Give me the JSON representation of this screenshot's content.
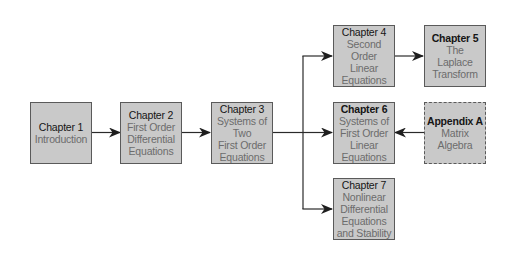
{
  "diagram": {
    "type": "flowchart",
    "colors": {
      "box_fill": "#c9c9c9",
      "box_border": "#5a5a5a",
      "title_text": "#151515",
      "subtitle_text": "#6c6c6c",
      "edge": "#2a2a2a"
    },
    "nodes": [
      {
        "id": "ch1",
        "title": "Chapter 1",
        "lines": [
          "Introduction"
        ],
        "style": "solid"
      },
      {
        "id": "ch2",
        "title": "Chapter 2",
        "lines": [
          "First Order",
          "Differential",
          "Equations"
        ],
        "style": "solid"
      },
      {
        "id": "ch3",
        "title": "Chapter 3",
        "lines": [
          "Systems of",
          "Two",
          "First Order",
          "Equations"
        ],
        "style": "solid"
      },
      {
        "id": "ch4",
        "title": "Chapter 4",
        "lines": [
          "Second",
          "Order",
          "Linear",
          "Equations"
        ],
        "style": "solid"
      },
      {
        "id": "ch5",
        "title": "Chapter 5",
        "lines": [
          "The",
          "Laplace",
          "Transform"
        ],
        "style": "solid"
      },
      {
        "id": "ch6",
        "title": "Chapter 6",
        "lines": [
          "Systems of",
          "First Order",
          "Linear",
          "Equations"
        ],
        "style": "solid"
      },
      {
        "id": "appA",
        "title": "Appendix A",
        "lines": [
          "Matrix",
          "Algebra"
        ],
        "style": "dashed"
      },
      {
        "id": "ch7",
        "title": "Chapter 7",
        "lines": [
          "Nonlinear",
          "Differential",
          "Equations",
          "and Stability"
        ],
        "style": "solid"
      }
    ],
    "edges": [
      {
        "from": "ch1",
        "to": "ch2"
      },
      {
        "from": "ch2",
        "to": "ch3"
      },
      {
        "from": "ch3",
        "to": "ch4"
      },
      {
        "from": "ch3",
        "to": "ch6"
      },
      {
        "from": "ch3",
        "to": "ch7"
      },
      {
        "from": "ch4",
        "to": "ch5"
      },
      {
        "from": "appA",
        "to": "ch6"
      }
    ]
  }
}
